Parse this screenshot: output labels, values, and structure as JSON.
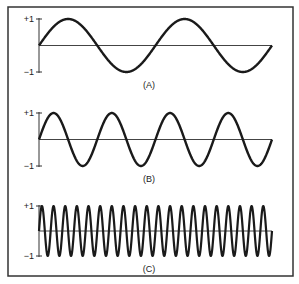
{
  "figure": {
    "panels": [
      {
        "id": "A",
        "label": "(A)",
        "y_max_label": "+1",
        "y_min_label": "−1",
        "cycles": 2,
        "top": 19,
        "bottom": 72,
        "label_y": 88
      },
      {
        "id": "B",
        "label": "(B)",
        "y_max_label": "+1",
        "y_min_label": "−1",
        "cycles": 4,
        "top": 113,
        "bottom": 166,
        "label_y": 182
      },
      {
        "id": "C",
        "label": "(C)",
        "y_max_label": "+1",
        "y_min_label": "−1",
        "cycles": 20,
        "top": 206,
        "bottom": 256,
        "label_y": 272
      }
    ],
    "colors": {
      "stroke": "#1a1a1a",
      "axis": "#333333",
      "frame": "#333333",
      "background": "#ffffff"
    }
  }
}
